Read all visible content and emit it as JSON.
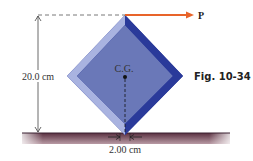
{
  "figure": {
    "caption": "Fig. 10-34",
    "force_label": "P",
    "height_label": "20.0 cm",
    "base_label": "2.00 cm",
    "center_label": "C.G."
  },
  "colors": {
    "block_face": "#6a78b8",
    "block_light_edge": "#a9b3e0",
    "block_dark_edge": "#2a3a9a",
    "arrow": "#e8642a",
    "ground": "#7a5060"
  }
}
